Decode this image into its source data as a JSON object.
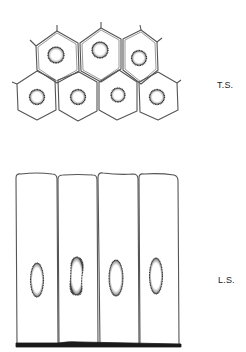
{
  "figure": {
    "transverse_section": {
      "label": "T.S.",
      "cell_count": 7,
      "rows": [
        {
          "cells": 3,
          "nuclei": [
            {
              "cx": 56,
              "cy": 55,
              "r": 8
            },
            {
              "cx": 100,
              "cy": 50,
              "r": 8
            },
            {
              "cx": 139,
              "cy": 58,
              "r": 7.5
            }
          ]
        },
        {
          "cells": 4,
          "nuclei": [
            {
              "cx": 37,
              "cy": 97,
              "r": 7.5
            },
            {
              "cx": 78,
              "cy": 97,
              "r": 7.5
            },
            {
              "cx": 118,
              "cy": 95,
              "r": 7
            },
            {
              "cx": 157,
              "cy": 97,
              "r": 7.5
            }
          ]
        }
      ]
    },
    "longitudinal_section": {
      "label": "L.S.",
      "cell_count": 4,
      "nuclei": [
        {
          "cx": 37,
          "cy": 280,
          "rx": 6.5,
          "ry": 17
        },
        {
          "cx": 77,
          "cy": 276,
          "rx": 6.5,
          "ry": 19
        },
        {
          "cx": 116,
          "cy": 278,
          "rx": 7,
          "ry": 18
        },
        {
          "cx": 156,
          "cy": 276,
          "rx": 6.5,
          "ry": 18
        }
      ]
    },
    "colors": {
      "line": "#555555",
      "nucleus": "#333333",
      "basement": "#1a1a1a"
    }
  }
}
